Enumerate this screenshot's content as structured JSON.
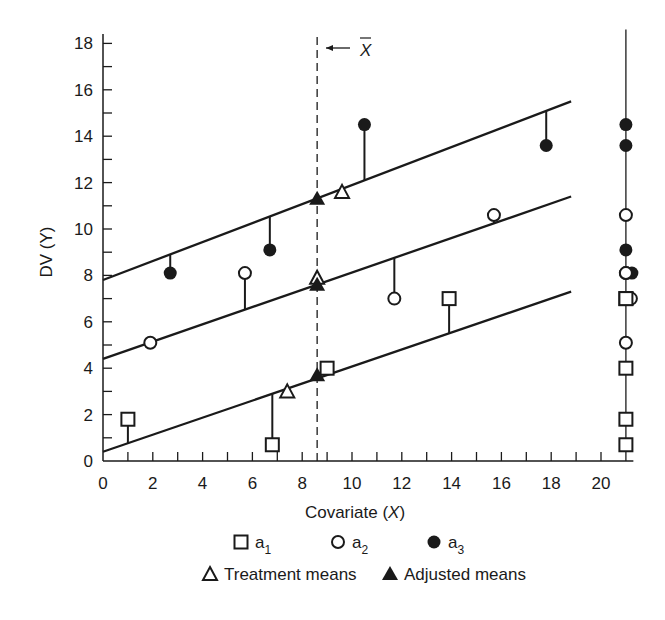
{
  "chart_data": {
    "type": "scatter",
    "title": "",
    "xlabel": "Covariate (X)",
    "ylabel": "DV (Y)",
    "xlim": [
      0,
      21
    ],
    "ylim": [
      0,
      18
    ],
    "xticks": [
      0,
      2,
      4,
      6,
      8,
      10,
      12,
      14,
      16,
      18,
      20
    ],
    "yticks": [
      0,
      2,
      4,
      6,
      8,
      10,
      12,
      14,
      16,
      18
    ],
    "grid": false,
    "xbar": 8.6,
    "xbar_label": "X̄",
    "series": [
      {
        "name": "a1",
        "marker": "open-square",
        "points": [
          [
            1.0,
            1.8
          ],
          [
            6.8,
            0.7
          ],
          [
            9.0,
            4.0
          ],
          [
            13.9,
            7.0
          ]
        ],
        "regression_line": {
          "x0": 0,
          "y0": 0.4,
          "x1": 18.8,
          "y1": 7.3
        }
      },
      {
        "name": "a2",
        "marker": "open-circle",
        "points": [
          [
            1.9,
            5.1
          ],
          [
            5.7,
            8.1
          ],
          [
            11.7,
            7.0
          ],
          [
            15.7,
            10.6
          ]
        ],
        "regression_line": {
          "x0": 0,
          "y0": 4.4,
          "x1": 18.8,
          "y1": 11.4
        }
      },
      {
        "name": "a3",
        "marker": "filled-circle",
        "points": [
          [
            2.7,
            8.1
          ],
          [
            6.7,
            9.1
          ],
          [
            10.5,
            14.5
          ],
          [
            17.8,
            13.6
          ]
        ],
        "regression_line": {
          "x0": 0,
          "y0": 7.8,
          "x1": 18.8,
          "y1": 15.5
        }
      }
    ],
    "treatment_means": [
      [
        7.4,
        3.0
      ],
      [
        8.6,
        7.9
      ],
      [
        9.6,
        11.6
      ]
    ],
    "adjusted_means": [
      [
        8.6,
        3.7
      ],
      [
        8.6,
        7.6
      ],
      [
        8.6,
        11.3
      ]
    ],
    "right_margin_projection": {
      "x": 21,
      "points": [
        {
          "marker": "filled-circle",
          "y": 14.5
        },
        {
          "marker": "filled-circle",
          "y": 13.6
        },
        {
          "marker": "open-circle",
          "y": 10.6
        },
        {
          "marker": "filled-circle",
          "y": 9.1
        },
        {
          "marker": "open-circle",
          "y": 8.1
        },
        {
          "marker": "filled-circle",
          "y": 8.1
        },
        {
          "marker": "open-square",
          "y": 7.0
        },
        {
          "marker": "open-circle",
          "y": 7.0
        },
        {
          "marker": "open-circle",
          "y": 5.1
        },
        {
          "marker": "open-square",
          "y": 4.0
        },
        {
          "marker": "open-square",
          "y": 1.8
        },
        {
          "marker": "open-square",
          "y": 0.7
        }
      ]
    },
    "legend": {
      "position": "bottom",
      "entries": [
        {
          "marker": "open-square",
          "label": "a",
          "subscript": "1"
        },
        {
          "marker": "open-circle",
          "label": "a",
          "subscript": "2"
        },
        {
          "marker": "filled-circle",
          "label": "a",
          "subscript": "3"
        },
        {
          "marker": "open-triangle",
          "label": "Treatment means"
        },
        {
          "marker": "filled-triangle",
          "label": "Adjusted means"
        }
      ]
    }
  },
  "labels": {
    "xlabel_main": "Covariate (",
    "xlabel_var": "X",
    "xlabel_end": ")",
    "ylabel": "DV (Y)",
    "xbar": "X"
  },
  "colors": {
    "ink": "#1a1a1a",
    "background": "#ffffff"
  }
}
